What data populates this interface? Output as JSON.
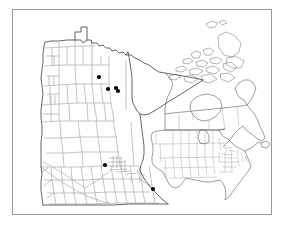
{
  "figure": {
    "type": "distribution-map",
    "title": "",
    "frame": {
      "border_color": "#999999",
      "background": "#ffffff"
    },
    "line_colors": {
      "state_outline": "#4a4a4a",
      "county_lines": "#9a9a9a",
      "inset_outline": "#555555",
      "inset_internal": "#9a9a9a",
      "point_marker": "#000000"
    }
  },
  "main_map": {
    "name": "Minnesota county map",
    "region": "Minnesota",
    "subdivisions": "counties",
    "outline_visible": true,
    "county_lines_visible": true,
    "occurrence_points": [
      {
        "id": "point-1",
        "x": 98,
        "y": 76,
        "label": ""
      },
      {
        "id": "point-2",
        "x": 107,
        "y": 88,
        "label": ""
      },
      {
        "id": "point-3",
        "x": 115,
        "y": 87,
        "label": ""
      },
      {
        "id": "point-4",
        "x": 117,
        "y": 90,
        "label": ""
      },
      {
        "id": "point-5",
        "x": 104,
        "y": 164,
        "label": ""
      },
      {
        "id": "point-6",
        "x": 152,
        "y": 188,
        "label": ""
      }
    ],
    "point_count": 6
  },
  "inset_map": {
    "name": "North America locator inset",
    "region": "North America",
    "includes": [
      "United States",
      "Canada",
      "Arctic islands"
    ],
    "subdivisions": "states and provinces",
    "shaded_region": "Minnesota",
    "occurrence_points": []
  },
  "chart_data": {
    "type": "map",
    "title": "",
    "series": [
      {
        "name": "occurrence records",
        "marker": "filled-circle",
        "color": "#000000",
        "points": [
          {
            "x": 98,
            "y": 76
          },
          {
            "x": 107,
            "y": 88
          },
          {
            "x": 115,
            "y": 87
          },
          {
            "x": 117,
            "y": 90
          },
          {
            "x": 104,
            "y": 164
          },
          {
            "x": 152,
            "y": 188
          }
        ]
      }
    ],
    "legend": [],
    "xlabel": "",
    "ylabel": ""
  }
}
